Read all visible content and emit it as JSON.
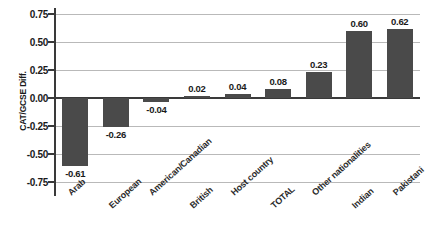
{
  "chart_data": {
    "type": "bar",
    "title": "",
    "xlabel": "",
    "ylabel": "CAT/GCSE Diff.",
    "categories": [
      "Arab",
      "European",
      "American/Canadian",
      "British",
      "Host country",
      "TOTAL",
      "Other nationalities",
      "Indian",
      "Pakistani"
    ],
    "values": [
      -0.61,
      -0.26,
      -0.04,
      0.02,
      0.04,
      0.08,
      0.23,
      0.6,
      0.62
    ],
    "value_labels": [
      "-0.61",
      "-0.26",
      "-0.04",
      "0.02",
      "0.04",
      "0.08",
      "0.23",
      "0.60",
      "0.62"
    ],
    "ylim": [
      -0.75,
      0.75
    ],
    "yticks": [
      0.75,
      0.5,
      0.25,
      0.0,
      -0.25,
      -0.5,
      -0.75
    ],
    "ytick_labels": [
      "0.75",
      "0.50",
      "0.25",
      "0.00",
      "-0.25",
      "-0.50",
      "-0.75"
    ],
    "grid": true,
    "legend": false,
    "bar_color": "#4a4a4a",
    "grid_color": "#b9b9b9",
    "axis_color": "#3a3a3a"
  }
}
